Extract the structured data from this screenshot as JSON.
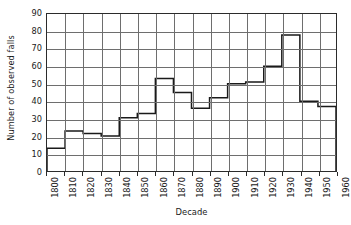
{
  "chart_data": {
    "type": "bar",
    "title": "",
    "xlabel": "Decade",
    "ylabel": "Number of observed falls",
    "categories": [
      "1800",
      "1810",
      "1820",
      "1830",
      "1840",
      "1850",
      "1860",
      "1870",
      "1880",
      "1890",
      "1900",
      "1910",
      "1920",
      "1930",
      "1940",
      "1950"
    ],
    "bin_edges": [
      "1800",
      "1810",
      "1820",
      "1830",
      "1840",
      "1850",
      "1860",
      "1870",
      "1880",
      "1890",
      "1900",
      "1910",
      "1920",
      "1930",
      "1940",
      "1950",
      "1960"
    ],
    "values": [
      13,
      23,
      21.5,
      20,
      30.5,
      33,
      53,
      45,
      36,
      42,
      50,
      51,
      60,
      78,
      40,
      37
    ],
    "ylim": [
      0,
      90
    ],
    "ytick_values": [
      0,
      10,
      20,
      30,
      40,
      50,
      60,
      70,
      80,
      90
    ],
    "ytick_labels": [
      "0",
      "10",
      "20",
      "30",
      "40",
      "50",
      "60",
      "70",
      "80",
      "90"
    ],
    "xtick_labels": [
      "1800",
      "1810",
      "1820",
      "1830",
      "1840",
      "1850",
      "1860",
      "1870",
      "1880",
      "1890",
      "1900",
      "1910",
      "1920",
      "1930",
      "1940",
      "1950",
      "1960"
    ],
    "grid": true,
    "legend": null,
    "line_color": "#1a1a1a",
    "grid_color": "#6e6e6e",
    "background_color": "#ffffff"
  }
}
